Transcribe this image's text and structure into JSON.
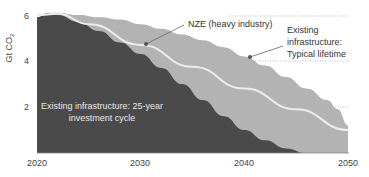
{
  "chart_data": {
    "type": "area",
    "title": "",
    "xlabel": "",
    "ylabel": "Gt CO2",
    "ylim": [
      0,
      6
    ],
    "xlim": [
      2020,
      2050
    ],
    "x_ticks": [
      "2020",
      "2030",
      "2040",
      "2050"
    ],
    "y_ticks": [
      "2",
      "4",
      "6"
    ],
    "grid": "dotted horizontal lines at 2, 4, 6 (partial, right side)",
    "legend": "none (inline annotations)",
    "series": [
      {
        "name": "Existing infrastructure: Typical lifetime",
        "kind": "area",
        "color": "#b3b3b3",
        "x": [
          2020,
          2021,
          2022,
          2024,
          2026,
          2028,
          2030,
          2032,
          2034,
          2036,
          2038,
          2040,
          2042,
          2044,
          2046,
          2048,
          2049,
          2050
        ],
        "values": [
          5.9,
          6.1,
          6.1,
          6.0,
          5.9,
          5.8,
          5.6,
          5.4,
          5.15,
          4.9,
          4.6,
          4.2,
          3.8,
          3.3,
          2.8,
          2.3,
          1.9,
          1.2
        ]
      },
      {
        "name": "Existing infrastructure: 25-year investment cycle",
        "kind": "area",
        "color": "#4a4a4a",
        "x": [
          2020,
          2021,
          2022,
          2024,
          2026,
          2028,
          2030,
          2032,
          2034,
          2036,
          2038,
          2040,
          2042,
          2044,
          2046
        ],
        "values": [
          5.9,
          6.05,
          6.0,
          5.7,
          5.3,
          4.8,
          4.3,
          3.7,
          3.0,
          2.3,
          1.6,
          1.0,
          0.55,
          0.2,
          0.0
        ]
      },
      {
        "name": "NZE (heavy industry)",
        "kind": "line",
        "color": "#ececec",
        "x": [
          2020,
          2022,
          2025,
          2030,
          2035,
          2040,
          2045,
          2050
        ],
        "values": [
          6.0,
          6.05,
          5.6,
          4.7,
          3.75,
          2.8,
          1.9,
          1.0
        ]
      }
    ],
    "annotations": [
      {
        "text": "NZE (heavy industry)",
        "target_x": 2030.5,
        "target_y": 4.8
      },
      {
        "text": "Existing infrastructure: Typical lifetime",
        "target_x": 2040.2,
        "target_y": 4.2
      },
      {
        "text": "Existing infrastructure: 25-year investment cycle",
        "position": "inside dark area"
      }
    ]
  },
  "labels": {
    "ylabel_main": "Gt CO",
    "ylabel_sub": "2",
    "y6": "6",
    "y4": "4",
    "y2": "2",
    "x2020": "2020",
    "x2030": "2030",
    "x2040": "2040",
    "x2050": "2050",
    "nze": "NZE (heavy industry)",
    "typical_l1": "Existing",
    "typical_l2": "infrastructure:",
    "typical_l3": "Typical lifetime",
    "cycle_l1": "Existing infrastructure: 25-year",
    "cycle_l2": "investment cycle"
  }
}
